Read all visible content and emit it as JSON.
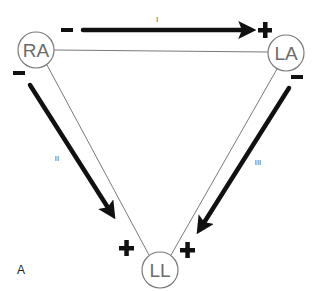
{
  "figure": {
    "panel_label": "A",
    "colors": {
      "arrow": "#111111",
      "triangle_edge": "#7a7a7a",
      "node_border": "#7a7a7a",
      "node_text": "#6b6b6b",
      "background": "#ffffff"
    },
    "nodes": [
      {
        "id": "RA",
        "label": "RA",
        "cx": 36,
        "cy": 50,
        "r": 18
      },
      {
        "id": "LA",
        "label": "LA",
        "cx": 286,
        "cy": 53,
        "r": 18
      },
      {
        "id": "LL",
        "label": "LL",
        "cx": 160,
        "cy": 270,
        "r": 18
      }
    ],
    "leads": [
      {
        "id": "I",
        "label": "I",
        "from": "RA",
        "to": "LA",
        "negative_sign": "−",
        "positive_sign": "+"
      },
      {
        "id": "II",
        "label": "II",
        "from": "RA",
        "to": "LL",
        "negative_sign": "−",
        "positive_sign": "+"
      },
      {
        "id": "III",
        "label": "III",
        "from": "LA",
        "to": "LL",
        "negative_sign": "−",
        "positive_sign": "+"
      }
    ]
  }
}
